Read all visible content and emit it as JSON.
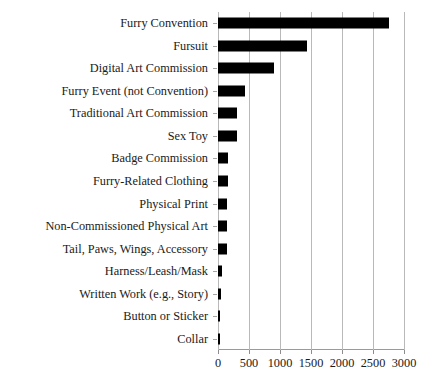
{
  "chart_data": {
    "type": "bar",
    "orientation": "horizontal",
    "title": "",
    "xlabel": "",
    "ylabel": "",
    "xlim": [
      0,
      3000
    ],
    "xticks": [
      0,
      500,
      1000,
      1500,
      2000,
      2500,
      3000
    ],
    "xtick_labels": [
      "0",
      "500",
      "1000",
      "1500",
      "2000",
      "2500",
      "3000"
    ],
    "grid": true,
    "legend": false,
    "bar_color": "#000000",
    "grid_color": "#b9b9b9",
    "categories": [
      "Furry Convention",
      "Fursuit",
      "Digital Art Commission",
      "Furry Event (not Convention)",
      "Traditional Art Commission",
      "Sex Toy",
      "Badge Commission",
      "Furry-Related Clothing",
      "Physical Print",
      "Non-Commissioned Physical Art",
      "Tail, Paws, Wings, Accessory",
      "Harness/Leash/Mask",
      "Written Work (e.g., Story)",
      "Button or Sticker",
      "Collar"
    ],
    "values": [
      2760,
      1430,
      900,
      440,
      310,
      310,
      160,
      155,
      150,
      150,
      145,
      70,
      55,
      40,
      35
    ]
  }
}
